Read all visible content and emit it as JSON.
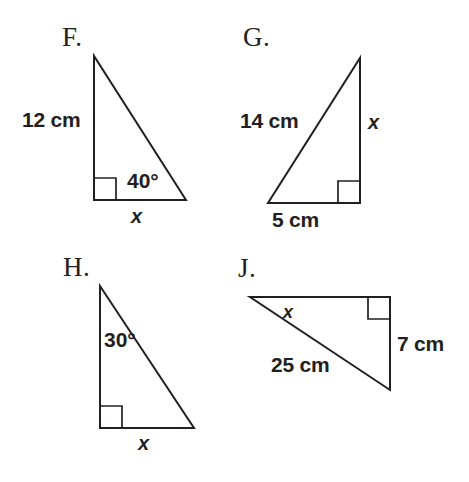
{
  "worksheet": {
    "title": "Right Triangle Trigonometry Problems",
    "background_color": "#ffffff",
    "line_color": "#231f20"
  },
  "problems": [
    {
      "letter": "F.",
      "shape": "right-triangle",
      "right_angle_vertex": "bottom-left",
      "labels": {
        "leg_vertical": "12 cm",
        "angle": "40°",
        "base": "x"
      }
    },
    {
      "letter": "G.",
      "shape": "right-triangle",
      "right_angle_vertex": "bottom-right",
      "labels": {
        "hypotenuse": "14 cm",
        "leg_vertical": "x",
        "base": "5 cm"
      }
    },
    {
      "letter": "H.",
      "shape": "right-triangle",
      "right_angle_vertex": "bottom-left",
      "labels": {
        "angle": "30°",
        "base": "x"
      }
    },
    {
      "letter": "J.",
      "shape": "right-triangle",
      "right_angle_vertex": "top-right",
      "labels": {
        "angle": "x",
        "leg_vertical": "7 cm",
        "hypotenuse": "25 cm"
      }
    }
  ]
}
